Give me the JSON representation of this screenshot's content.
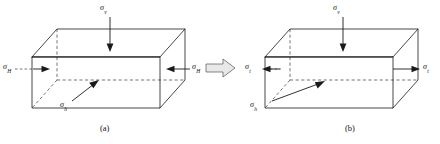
{
  "figure": {
    "caption_a": "(a)",
    "caption_b": "(b)",
    "transition_arrow": "double-right-block-arrow"
  },
  "panel_a": {
    "label": "(a)",
    "stress_vertical": {
      "symbol": "σ",
      "subscript": "v",
      "direction": "down",
      "name": "vertical-stress"
    },
    "stress_horizontal_left": {
      "symbol": "σ",
      "subscript": "H",
      "direction": "inward-right",
      "name": "horizontal-stress-left"
    },
    "stress_horizontal_right": {
      "symbol": "σ",
      "subscript": "H",
      "direction": "inward-left",
      "name": "horizontal-stress-right"
    },
    "stress_bottom": {
      "symbol": "σ",
      "subscript": "h",
      "direction": "up-right",
      "name": "minor-horizontal-stress"
    }
  },
  "panel_b": {
    "label": "(b)",
    "stress_vertical": {
      "symbol": "σ",
      "subscript": "v",
      "direction": "down",
      "name": "vertical-stress"
    },
    "stress_horizontal_left": {
      "symbol": "σ",
      "subscript": "t",
      "direction": "outward-left",
      "name": "tensile-stress-left"
    },
    "stress_horizontal_right": {
      "symbol": "σ",
      "subscript": "t",
      "direction": "outward-right",
      "name": "tensile-stress-right"
    },
    "stress_bottom": {
      "symbol": "σ",
      "subscript": "h",
      "direction": "up-right",
      "name": "minor-horizontal-stress"
    }
  },
  "colors": {
    "stroke": "#1a1a1a",
    "hidden_edge": "#3a3a3a",
    "background": "#ffffff",
    "block_arrow_fill": "#e8e8e8"
  }
}
